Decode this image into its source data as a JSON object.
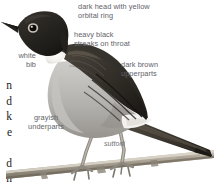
{
  "figure": {
    "kind": "bird-field-guide-illustration",
    "subspecies_label": "suttoni"
  },
  "annotations": {
    "head": "dark head with yellow\norbital ring",
    "throat": "heavy black\nstreaks on throat",
    "bib": "white\nbib",
    "upperparts": "dark brown\nupperparts",
    "underparts": "grayish\nunderparts",
    "suttoni": "suttoni"
  },
  "margin_text": "n\nd\nk\ne\n\nd\nh\ne",
  "colors": {
    "label_text": "#63636a",
    "margin_text": "#1c1c1c",
    "background": "#ffffff",
    "head_dark": "#2a2723",
    "upperparts_brown": "#4d4740",
    "underparts_gray": "#b2b0ad",
    "bib_white": "#f2f1ef",
    "branch": "#9a9287",
    "leg": "#a9a49c"
  }
}
